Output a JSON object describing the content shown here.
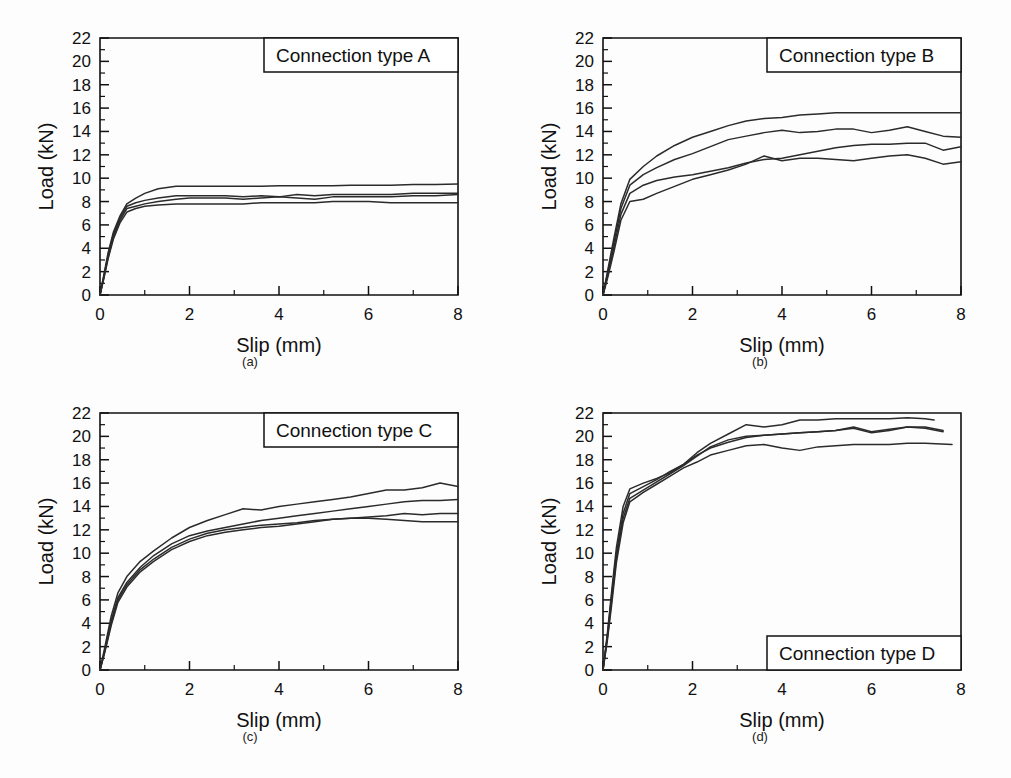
{
  "figure": {
    "background": "#ffffff",
    "ink_color": "#2b2b2b",
    "panels": [
      "a",
      "b",
      "c",
      "d"
    ]
  },
  "axes": {
    "xlabel": "Slip (mm)",
    "ylabel": "Load (kN)",
    "xticks": [
      "0",
      "2",
      "4",
      "6",
      "8"
    ],
    "yticks": [
      "0",
      "2",
      "4",
      "6",
      "8",
      "10",
      "12",
      "14",
      "16",
      "18",
      "20",
      "22"
    ],
    "xlim": [
      0,
      8
    ],
    "ylim": [
      0,
      22
    ]
  },
  "panel_a": {
    "caption": "(a)",
    "box_label": "Connection type A",
    "box_position": "top-right"
  },
  "panel_b": {
    "caption": "(b)",
    "box_label": "Connection type B",
    "box_position": "top-right"
  },
  "panel_c": {
    "caption": "(c)",
    "box_label": "Connection type C",
    "box_position": "top-right"
  },
  "panel_d": {
    "caption": "(d)",
    "box_label": "Connection type D",
    "box_position": "bottom-right"
  },
  "chart_data": [
    {
      "id": "panel-a",
      "type": "line",
      "title": "Connection type A",
      "caption": "(a)",
      "xlabel": "Slip (mm)",
      "ylabel": "Load (kN)",
      "xlim": [
        0,
        8
      ],
      "ylim": [
        0,
        22
      ],
      "xticks": [
        0,
        2,
        4,
        6,
        8
      ],
      "yticks": [
        0,
        2,
        4,
        6,
        8,
        10,
        12,
        14,
        16,
        18,
        20,
        22
      ],
      "grid": false,
      "legend": "none",
      "series": [
        {
          "name": "specimen 1",
          "x": [
            0,
            0.08,
            0.18,
            0.3,
            0.45,
            0.6,
            0.8,
            1.0,
            1.3,
            1.7,
            2.0,
            2.4,
            2.8,
            3.2,
            3.6,
            4.0,
            4.4,
            4.8,
            5.2,
            5.6,
            6.0,
            6.5,
            7.0,
            7.5,
            8.0
          ],
          "y": [
            0,
            1.6,
            3.6,
            5.4,
            6.8,
            7.8,
            8.3,
            8.7,
            9.1,
            9.3,
            9.3,
            9.3,
            9.3,
            9.3,
            9.3,
            9.35,
            9.35,
            9.35,
            9.35,
            9.4,
            9.4,
            9.4,
            9.45,
            9.45,
            9.5
          ]
        },
        {
          "name": "specimen 2",
          "x": [
            0,
            0.08,
            0.18,
            0.3,
            0.45,
            0.6,
            0.8,
            1.0,
            1.3,
            1.7,
            2.0,
            2.4,
            2.8,
            3.2,
            3.6,
            4.0,
            4.4,
            4.8,
            5.2,
            5.6,
            6.0,
            6.5,
            7.0,
            7.5,
            8.0
          ],
          "y": [
            0,
            1.5,
            3.4,
            5.2,
            6.6,
            7.6,
            7.9,
            8.1,
            8.3,
            8.5,
            8.5,
            8.5,
            8.5,
            8.4,
            8.5,
            8.4,
            8.6,
            8.5,
            8.6,
            8.6,
            8.6,
            8.6,
            8.7,
            8.7,
            8.7
          ]
        },
        {
          "name": "specimen 3",
          "x": [
            0,
            0.08,
            0.18,
            0.3,
            0.45,
            0.6,
            0.8,
            1.0,
            1.3,
            1.7,
            2.0,
            2.4,
            2.8,
            3.2,
            3.6,
            4.0,
            4.4,
            4.8,
            5.2,
            5.6,
            6.0,
            6.5,
            7.0,
            7.5,
            8.0
          ],
          "y": [
            0,
            1.4,
            3.2,
            5.0,
            6.4,
            7.4,
            7.6,
            7.8,
            8.0,
            8.2,
            8.3,
            8.3,
            8.3,
            8.2,
            8.3,
            8.4,
            8.3,
            8.2,
            8.4,
            8.4,
            8.4,
            8.4,
            8.5,
            8.5,
            8.6
          ]
        },
        {
          "name": "specimen 4",
          "x": [
            0,
            0.08,
            0.18,
            0.3,
            0.45,
            0.6,
            0.8,
            1.0,
            1.3,
            1.7,
            2.0,
            2.4,
            2.8,
            3.2,
            3.6,
            4.0,
            4.4,
            4.8,
            5.2,
            5.6,
            6.0,
            6.5,
            7.0,
            7.5,
            8.0
          ],
          "y": [
            0,
            1.3,
            3.1,
            4.8,
            6.2,
            7.1,
            7.4,
            7.6,
            7.7,
            7.8,
            7.8,
            7.8,
            7.8,
            7.8,
            7.9,
            7.9,
            7.9,
            7.9,
            8.0,
            8.0,
            8.0,
            7.9,
            7.9,
            7.9,
            7.9
          ]
        }
      ]
    },
    {
      "id": "panel-b",
      "type": "line",
      "title": "Connection type B",
      "caption": "(b)",
      "xlabel": "Slip (mm)",
      "ylabel": "Load (kN)",
      "xlim": [
        0,
        8
      ],
      "ylim": [
        0,
        22
      ],
      "xticks": [
        0,
        2,
        4,
        6,
        8
      ],
      "yticks": [
        0,
        2,
        4,
        6,
        8,
        10,
        12,
        14,
        16,
        18,
        20,
        22
      ],
      "grid": false,
      "legend": "none",
      "series": [
        {
          "name": "specimen 1",
          "x": [
            0,
            0.1,
            0.25,
            0.4,
            0.6,
            0.9,
            1.2,
            1.6,
            2.0,
            2.4,
            2.8,
            3.2,
            3.6,
            4.0,
            4.4,
            4.8,
            5.2,
            5.6,
            6.0,
            6.4,
            6.8,
            7.2,
            7.6,
            8.0
          ],
          "y": [
            0,
            2.0,
            5.0,
            7.8,
            9.9,
            11.0,
            11.9,
            12.8,
            13.5,
            14.0,
            14.5,
            14.9,
            15.1,
            15.2,
            15.4,
            15.5,
            15.6,
            15.6,
            15.6,
            15.6,
            15.6,
            15.6,
            15.6,
            15.6
          ]
        },
        {
          "name": "specimen 2",
          "x": [
            0,
            0.1,
            0.25,
            0.4,
            0.6,
            0.9,
            1.2,
            1.6,
            2.0,
            2.4,
            2.8,
            3.2,
            3.6,
            4.0,
            4.4,
            4.8,
            5.2,
            5.6,
            6.0,
            6.4,
            6.8,
            7.2,
            7.6,
            8.0
          ],
          "y": [
            0,
            1.8,
            4.6,
            7.4,
            9.4,
            10.3,
            10.9,
            11.6,
            12.1,
            12.7,
            13.3,
            13.6,
            13.9,
            14.1,
            13.9,
            14.0,
            14.2,
            14.2,
            13.9,
            14.1,
            14.4,
            14.0,
            13.6,
            13.5
          ]
        },
        {
          "name": "specimen 3",
          "x": [
            0,
            0.1,
            0.25,
            0.4,
            0.6,
            0.9,
            1.2,
            1.6,
            2.0,
            2.4,
            2.8,
            3.2,
            3.6,
            4.0,
            4.4,
            4.8,
            5.2,
            5.6,
            6.0,
            6.4,
            6.8,
            7.2,
            7.6,
            8.0
          ],
          "y": [
            0,
            1.6,
            4.2,
            6.9,
            8.7,
            9.4,
            9.8,
            10.1,
            10.3,
            10.6,
            10.9,
            11.3,
            11.6,
            11.7,
            12.0,
            12.3,
            12.6,
            12.8,
            12.9,
            12.9,
            13.0,
            13.0,
            12.4,
            12.7
          ]
        },
        {
          "name": "specimen 4",
          "x": [
            0,
            0.1,
            0.25,
            0.4,
            0.6,
            0.9,
            1.2,
            1.6,
            2.0,
            2.4,
            2.8,
            3.2,
            3.6,
            4.0,
            4.4,
            4.8,
            5.2,
            5.6,
            6.0,
            6.4,
            6.8,
            7.2,
            7.6,
            8.0
          ],
          "y": [
            0,
            1.4,
            3.8,
            6.4,
            8.0,
            8.2,
            8.7,
            9.3,
            9.9,
            10.3,
            10.7,
            11.2,
            11.9,
            11.5,
            11.7,
            11.7,
            11.6,
            11.5,
            11.7,
            11.9,
            12.0,
            11.7,
            11.2,
            11.4
          ]
        }
      ]
    },
    {
      "id": "panel-c",
      "type": "line",
      "title": "Connection type C",
      "caption": "(c)",
      "xlabel": "Slip (mm)",
      "ylabel": "Load (kN)",
      "xlim": [
        0,
        8
      ],
      "ylim": [
        0,
        22
      ],
      "xticks": [
        0,
        2,
        4,
        6,
        8
      ],
      "yticks": [
        0,
        2,
        4,
        6,
        8,
        10,
        12,
        14,
        16,
        18,
        20,
        22
      ],
      "grid": false,
      "legend": "none",
      "series": [
        {
          "name": "specimen 1",
          "x": [
            0,
            0.1,
            0.25,
            0.4,
            0.6,
            0.9,
            1.2,
            1.6,
            2.0,
            2.4,
            2.8,
            3.2,
            3.6,
            4.0,
            4.4,
            4.8,
            5.2,
            5.6,
            6.0,
            6.4,
            6.8,
            7.2,
            7.6,
            8.0
          ],
          "y": [
            0,
            1.8,
            4.6,
            6.6,
            8.0,
            9.3,
            10.2,
            11.3,
            12.2,
            12.8,
            13.3,
            13.8,
            13.7,
            14.0,
            14.2,
            14.4,
            14.6,
            14.8,
            15.1,
            15.4,
            15.4,
            15.6,
            16.0,
            15.7
          ]
        },
        {
          "name": "specimen 2",
          "x": [
            0,
            0.1,
            0.25,
            0.4,
            0.6,
            0.9,
            1.2,
            1.6,
            2.0,
            2.4,
            2.8,
            3.2,
            3.6,
            4.0,
            4.4,
            4.8,
            5.2,
            5.6,
            6.0,
            6.4,
            6.8,
            7.2,
            7.6,
            8.0
          ],
          "y": [
            0,
            1.6,
            4.2,
            6.2,
            7.5,
            8.8,
            9.8,
            10.8,
            11.5,
            11.9,
            12.2,
            12.5,
            12.8,
            13.0,
            13.2,
            13.4,
            13.6,
            13.8,
            14.0,
            14.2,
            14.4,
            14.5,
            14.5,
            14.6
          ]
        },
        {
          "name": "specimen 3",
          "x": [
            0,
            0.1,
            0.25,
            0.4,
            0.6,
            0.9,
            1.2,
            1.6,
            2.0,
            2.4,
            2.8,
            3.2,
            3.6,
            4.0,
            4.4,
            4.8,
            5.2,
            5.6,
            6.0,
            6.4,
            6.8,
            7.2,
            7.6,
            8.0
          ],
          "y": [
            0,
            1.5,
            4.0,
            6.0,
            7.3,
            8.6,
            9.5,
            10.5,
            11.2,
            11.7,
            12.0,
            12.2,
            12.4,
            12.5,
            12.6,
            12.8,
            12.9,
            13.0,
            13.1,
            13.2,
            13.4,
            13.3,
            13.4,
            13.4
          ]
        },
        {
          "name": "specimen 4",
          "x": [
            0,
            0.1,
            0.25,
            0.4,
            0.6,
            0.9,
            1.2,
            1.6,
            2.0,
            2.4,
            2.8,
            3.2,
            3.6,
            4.0,
            4.4,
            4.8,
            5.2,
            5.6,
            6.0,
            6.4,
            6.8,
            7.2,
            7.6,
            8.0
          ],
          "y": [
            0,
            1.4,
            3.8,
            5.8,
            7.1,
            8.4,
            9.3,
            10.3,
            11.0,
            11.5,
            11.8,
            12.0,
            12.2,
            12.3,
            12.5,
            12.7,
            12.9,
            13.0,
            13.0,
            12.9,
            12.8,
            12.7,
            12.7,
            12.7
          ]
        }
      ]
    },
    {
      "id": "panel-d",
      "type": "line",
      "title": "Connection type D",
      "caption": "(d)",
      "xlabel": "Slip (mm)",
      "ylabel": "Load (kN)",
      "xlim": [
        0,
        8
      ],
      "ylim": [
        0,
        22
      ],
      "xticks": [
        0,
        2,
        4,
        6,
        8
      ],
      "yticks": [
        0,
        2,
        4,
        6,
        8,
        10,
        12,
        14,
        16,
        18,
        20,
        22
      ],
      "grid": false,
      "legend": "none",
      "series": [
        {
          "name": "specimen 1",
          "x": [
            0,
            0.1,
            0.2,
            0.3,
            0.45,
            0.6,
            0.9,
            1.2,
            1.5,
            1.8,
            2.1,
            2.4,
            2.8,
            3.2,
            3.6,
            4.0,
            4.4,
            4.8,
            5.2,
            5.6,
            6.0,
            6.4,
            6.8,
            7.2,
            7.4
          ],
          "y": [
            0,
            3.2,
            7.0,
            10.5,
            14.0,
            15.5,
            16.0,
            16.4,
            16.9,
            17.6,
            18.6,
            19.4,
            20.2,
            21.0,
            20.8,
            21.0,
            21.4,
            21.4,
            21.5,
            21.5,
            21.5,
            21.5,
            21.6,
            21.5,
            21.4
          ]
        },
        {
          "name": "specimen 2",
          "x": [
            0,
            0.1,
            0.2,
            0.3,
            0.45,
            0.6,
            0.9,
            1.2,
            1.5,
            1.8,
            2.1,
            2.4,
            2.8,
            3.2,
            3.6,
            4.0,
            4.4,
            4.8,
            5.2,
            5.6,
            6.0,
            6.4,
            6.8,
            7.2,
            7.6
          ],
          "y": [
            0,
            3.0,
            6.6,
            10.0,
            13.4,
            15.1,
            15.7,
            16.3,
            17.0,
            17.6,
            18.4,
            19.0,
            19.5,
            19.9,
            20.1,
            20.2,
            20.3,
            20.4,
            20.5,
            20.7,
            20.3,
            20.5,
            20.8,
            20.7,
            20.4
          ]
        },
        {
          "name": "specimen 3",
          "x": [
            0,
            0.1,
            0.2,
            0.3,
            0.45,
            0.6,
            0.9,
            1.2,
            1.5,
            1.8,
            2.1,
            2.4,
            2.8,
            3.2,
            3.6,
            4.0,
            4.4,
            4.8,
            5.2,
            5.6,
            6.0,
            6.4,
            6.8,
            7.2,
            7.6
          ],
          "y": [
            0,
            2.8,
            6.2,
            9.6,
            13.0,
            14.7,
            15.4,
            16.1,
            16.8,
            17.5,
            18.3,
            19.1,
            19.7,
            20.0,
            20.1,
            20.2,
            20.3,
            20.4,
            20.5,
            20.8,
            20.4,
            20.6,
            20.8,
            20.8,
            20.5
          ]
        },
        {
          "name": "specimen 4",
          "x": [
            0,
            0.1,
            0.2,
            0.3,
            0.45,
            0.6,
            0.9,
            1.2,
            1.5,
            1.8,
            2.1,
            2.4,
            2.8,
            3.2,
            3.6,
            4.0,
            4.4,
            4.8,
            5.2,
            5.6,
            6.0,
            6.4,
            6.8,
            7.2,
            7.8
          ],
          "y": [
            0,
            2.6,
            5.8,
            9.2,
            12.6,
            14.4,
            15.2,
            15.9,
            16.6,
            17.3,
            17.8,
            18.4,
            18.8,
            19.2,
            19.3,
            19.0,
            18.8,
            19.1,
            19.2,
            19.3,
            19.3,
            19.3,
            19.4,
            19.4,
            19.3
          ]
        }
      ]
    }
  ]
}
